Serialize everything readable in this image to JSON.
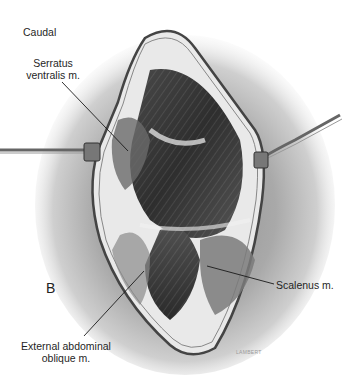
{
  "figure": {
    "panel_letter": "B",
    "orientation_label": "Caudal",
    "labels": [
      {
        "id": "serratus",
        "lines": [
          "Serratus",
          "ventralis m."
        ]
      },
      {
        "id": "scalenus",
        "lines": [
          "Scalenus m."
        ]
      },
      {
        "id": "external-oblique",
        "lines": [
          "External abdominal",
          "oblique m."
        ]
      }
    ],
    "artist_signature": "LAMBERT",
    "colors": {
      "background": "#ffffff",
      "skin_shading": "#b8b8b8",
      "muscle_dark": "#3a3a3a",
      "muscle_mid": "#7a7a7a",
      "retractor": "#555555",
      "leader_line": "#1a1a1a"
    }
  }
}
